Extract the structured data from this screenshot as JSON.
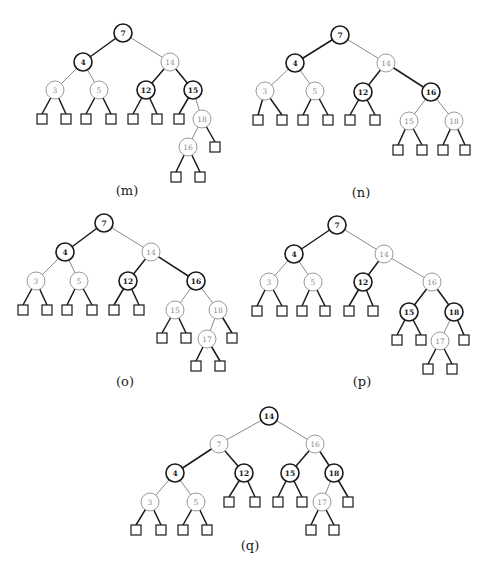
{
  "figure": {
    "colors": {
      "black_node": "#1a1a1a",
      "red_node": "#8a8a8a",
      "background": "#ffffff"
    },
    "node_radius": 9,
    "leaf_size": 10,
    "panels": [
      {
        "id": "m",
        "caption": "(m)",
        "caption_pos": [
          127,
          190
        ],
        "nodes": [
          {
            "id": "n7",
            "label": "7",
            "color": "black",
            "x": 123,
            "y": 33
          },
          {
            "id": "n4",
            "label": "4",
            "color": "black",
            "x": 83,
            "y": 62
          },
          {
            "id": "n14",
            "label": "14",
            "color": "red",
            "x": 170,
            "y": 62
          },
          {
            "id": "n3",
            "label": "3",
            "color": "red",
            "x": 55,
            "y": 90
          },
          {
            "id": "n5",
            "label": "5",
            "color": "red",
            "x": 99,
            "y": 90
          },
          {
            "id": "n12",
            "label": "12",
            "color": "black",
            "x": 146,
            "y": 90
          },
          {
            "id": "n15",
            "label": "15",
            "color": "black",
            "x": 193,
            "y": 90
          },
          {
            "id": "n18",
            "label": "18",
            "color": "red",
            "x": 202,
            "y": 119
          },
          {
            "id": "n16",
            "label": "16",
            "color": "red",
            "x": 188,
            "y": 147
          }
        ],
        "leaves": [
          {
            "id": "l1",
            "x": 42,
            "y": 119,
            "parent": "n3"
          },
          {
            "id": "l2",
            "x": 66,
            "y": 119,
            "parent": "n3"
          },
          {
            "id": "l3",
            "x": 86,
            "y": 119,
            "parent": "n5"
          },
          {
            "id": "l4",
            "x": 111,
            "y": 119,
            "parent": "n5"
          },
          {
            "id": "l5",
            "x": 133,
            "y": 119,
            "parent": "n12"
          },
          {
            "id": "l6",
            "x": 157,
            "y": 119,
            "parent": "n12"
          },
          {
            "id": "l7",
            "x": 179,
            "y": 119,
            "parent": "n15"
          },
          {
            "id": "l8",
            "x": 215,
            "y": 147,
            "parent": "n18"
          },
          {
            "id": "l9",
            "x": 176,
            "y": 177,
            "parent": "n16"
          },
          {
            "id": "l10",
            "x": 200,
            "y": 177,
            "parent": "n16"
          }
        ],
        "edges": [
          [
            "n7",
            "n4"
          ],
          [
            "n7",
            "n14"
          ],
          [
            "n4",
            "n3"
          ],
          [
            "n4",
            "n5"
          ],
          [
            "n14",
            "n12"
          ],
          [
            "n14",
            "n15"
          ],
          [
            "n15",
            "n18"
          ],
          [
            "n18",
            "n16"
          ]
        ]
      },
      {
        "id": "n",
        "caption": "(n)",
        "caption_pos": [
          361,
          192
        ],
        "nodes": [
          {
            "id": "n7",
            "label": "7",
            "color": "black",
            "x": 340,
            "y": 35
          },
          {
            "id": "n4",
            "label": "4",
            "color": "black",
            "x": 295,
            "y": 63
          },
          {
            "id": "n14",
            "label": "14",
            "color": "red",
            "x": 386,
            "y": 63
          },
          {
            "id": "n3",
            "label": "3",
            "color": "red",
            "x": 265,
            "y": 91
          },
          {
            "id": "n5",
            "label": "5",
            "color": "red",
            "x": 315,
            "y": 91
          },
          {
            "id": "n12",
            "label": "12",
            "color": "black",
            "x": 363,
            "y": 92
          },
          {
            "id": "n16",
            "label": "16",
            "color": "black",
            "x": 431,
            "y": 92
          },
          {
            "id": "n15",
            "label": "15",
            "color": "red",
            "x": 409,
            "y": 121
          },
          {
            "id": "n18",
            "label": "18",
            "color": "red",
            "x": 454,
            "y": 121
          }
        ],
        "leaves": [
          {
            "id": "l1",
            "x": 258,
            "y": 120,
            "parent": "n3"
          },
          {
            "id": "l2",
            "x": 282,
            "y": 120,
            "parent": "n3"
          },
          {
            "id": "l3",
            "x": 303,
            "y": 120,
            "parent": "n5"
          },
          {
            "id": "l4",
            "x": 328,
            "y": 120,
            "parent": "n5"
          },
          {
            "id": "l5",
            "x": 350,
            "y": 120,
            "parent": "n12"
          },
          {
            "id": "l6",
            "x": 375,
            "y": 120,
            "parent": "n12"
          },
          {
            "id": "l7",
            "x": 398,
            "y": 150,
            "parent": "n15"
          },
          {
            "id": "l8",
            "x": 422,
            "y": 150,
            "parent": "n15"
          },
          {
            "id": "l9",
            "x": 443,
            "y": 150,
            "parent": "n18"
          },
          {
            "id": "l10",
            "x": 465,
            "y": 150,
            "parent": "n18"
          }
        ],
        "edges": [
          [
            "n7",
            "n4"
          ],
          [
            "n7",
            "n14"
          ],
          [
            "n4",
            "n3"
          ],
          [
            "n4",
            "n5"
          ],
          [
            "n14",
            "n12"
          ],
          [
            "n14",
            "n16"
          ],
          [
            "n16",
            "n15"
          ],
          [
            "n16",
            "n18"
          ]
        ]
      },
      {
        "id": "o",
        "caption": "(o)",
        "caption_pos": [
          125,
          381
        ],
        "nodes": [
          {
            "id": "n7",
            "label": "7",
            "color": "black",
            "x": 104,
            "y": 223
          },
          {
            "id": "n4",
            "label": "4",
            "color": "black",
            "x": 65,
            "y": 252
          },
          {
            "id": "n14",
            "label": "14",
            "color": "red",
            "x": 151,
            "y": 252
          },
          {
            "id": "n3",
            "label": "3",
            "color": "red",
            "x": 36,
            "y": 281
          },
          {
            "id": "n5",
            "label": "5",
            "color": "red",
            "x": 79,
            "y": 281
          },
          {
            "id": "n12",
            "label": "12",
            "color": "black",
            "x": 128,
            "y": 281
          },
          {
            "id": "n16",
            "label": "16",
            "color": "black",
            "x": 196,
            "y": 281
          },
          {
            "id": "n15",
            "label": "15",
            "color": "red",
            "x": 175,
            "y": 310
          },
          {
            "id": "n18",
            "label": "18",
            "color": "red",
            "x": 218,
            "y": 310
          },
          {
            "id": "n17",
            "label": "17",
            "color": "red",
            "x": 207,
            "y": 339
          }
        ],
        "leaves": [
          {
            "id": "l1",
            "x": 23,
            "y": 310,
            "parent": "n3"
          },
          {
            "id": "l2",
            "x": 47,
            "y": 310,
            "parent": "n3"
          },
          {
            "id": "l3",
            "x": 67,
            "y": 310,
            "parent": "n5"
          },
          {
            "id": "l4",
            "x": 92,
            "y": 310,
            "parent": "n5"
          },
          {
            "id": "l5",
            "x": 114,
            "y": 310,
            "parent": "n12"
          },
          {
            "id": "l6",
            "x": 139,
            "y": 310,
            "parent": "n12"
          },
          {
            "id": "l7",
            "x": 162,
            "y": 338,
            "parent": "n15"
          },
          {
            "id": "l8",
            "x": 186,
            "y": 338,
            "parent": "n15"
          },
          {
            "id": "l9",
            "x": 232,
            "y": 338,
            "parent": "n18"
          },
          {
            "id": "l10",
            "x": 196,
            "y": 366,
            "parent": "n17"
          },
          {
            "id": "l11",
            "x": 220,
            "y": 366,
            "parent": "n17"
          }
        ],
        "edges": [
          [
            "n7",
            "n4"
          ],
          [
            "n7",
            "n14"
          ],
          [
            "n4",
            "n3"
          ],
          [
            "n4",
            "n5"
          ],
          [
            "n14",
            "n12"
          ],
          [
            "n14",
            "n16"
          ],
          [
            "n16",
            "n15"
          ],
          [
            "n16",
            "n18"
          ],
          [
            "n18",
            "n17"
          ]
        ]
      },
      {
        "id": "p",
        "caption": "(p)",
        "caption_pos": [
          362,
          381
        ],
        "nodes": [
          {
            "id": "n7",
            "label": "7",
            "color": "black",
            "x": 337,
            "y": 225
          },
          {
            "id": "n4",
            "label": "4",
            "color": "black",
            "x": 294,
            "y": 254
          },
          {
            "id": "n14",
            "label": "14",
            "color": "red",
            "x": 384,
            "y": 254
          },
          {
            "id": "n3",
            "label": "3",
            "color": "red",
            "x": 269,
            "y": 282
          },
          {
            "id": "n5",
            "label": "5",
            "color": "red",
            "x": 313,
            "y": 282
          },
          {
            "id": "n12",
            "label": "12",
            "color": "black",
            "x": 363,
            "y": 282
          },
          {
            "id": "n16",
            "label": "16",
            "color": "red",
            "x": 432,
            "y": 282
          },
          {
            "id": "n15",
            "label": "15",
            "color": "black",
            "x": 409,
            "y": 312
          },
          {
            "id": "n18",
            "label": "18",
            "color": "black",
            "x": 454,
            "y": 312
          },
          {
            "id": "n17",
            "label": "17",
            "color": "red",
            "x": 440,
            "y": 341
          }
        ],
        "leaves": [
          {
            "id": "l1",
            "x": 257,
            "y": 311,
            "parent": "n3"
          },
          {
            "id": "l2",
            "x": 282,
            "y": 311,
            "parent": "n3"
          },
          {
            "id": "l3",
            "x": 302,
            "y": 311,
            "parent": "n5"
          },
          {
            "id": "l4",
            "x": 325,
            "y": 311,
            "parent": "n5"
          },
          {
            "id": "l5",
            "x": 349,
            "y": 311,
            "parent": "n12"
          },
          {
            "id": "l6",
            "x": 373,
            "y": 311,
            "parent": "n12"
          },
          {
            "id": "l7",
            "x": 397,
            "y": 340,
            "parent": "n15"
          },
          {
            "id": "l8",
            "x": 421,
            "y": 340,
            "parent": "n15"
          },
          {
            "id": "l9",
            "x": 464,
            "y": 340,
            "parent": "n18"
          },
          {
            "id": "l10",
            "x": 428,
            "y": 369,
            "parent": "n17"
          },
          {
            "id": "l11",
            "x": 452,
            "y": 369,
            "parent": "n17"
          }
        ],
        "edges": [
          [
            "n7",
            "n4"
          ],
          [
            "n7",
            "n14"
          ],
          [
            "n4",
            "n3"
          ],
          [
            "n4",
            "n5"
          ],
          [
            "n14",
            "n12"
          ],
          [
            "n14",
            "n16"
          ],
          [
            "n16",
            "n15"
          ],
          [
            "n16",
            "n18"
          ],
          [
            "n18",
            "n17"
          ]
        ]
      },
      {
        "id": "q",
        "caption": "(q)",
        "caption_pos": [
          250,
          545
        ],
        "nodes": [
          {
            "id": "n14",
            "label": "14",
            "color": "black",
            "x": 269,
            "y": 416
          },
          {
            "id": "n7",
            "label": "7",
            "color": "red",
            "x": 219,
            "y": 444
          },
          {
            "id": "n16",
            "label": "16",
            "color": "red",
            "x": 315,
            "y": 444
          },
          {
            "id": "n4",
            "label": "4",
            "color": "black",
            "x": 175,
            "y": 473
          },
          {
            "id": "n12",
            "label": "12",
            "color": "black",
            "x": 244,
            "y": 473
          },
          {
            "id": "n15",
            "label": "15",
            "color": "black",
            "x": 290,
            "y": 473
          },
          {
            "id": "n18",
            "label": "18",
            "color": "black",
            "x": 334,
            "y": 473
          },
          {
            "id": "n3",
            "label": "3",
            "color": "red",
            "x": 150,
            "y": 502
          },
          {
            "id": "n5",
            "label": "5",
            "color": "red",
            "x": 196,
            "y": 502
          },
          {
            "id": "n17",
            "label": "17",
            "color": "red",
            "x": 322,
            "y": 502
          }
        ],
        "leaves": [
          {
            "id": "l1",
            "x": 229,
            "y": 502,
            "parent": "n12"
          },
          {
            "id": "l2",
            "x": 255,
            "y": 502,
            "parent": "n12"
          },
          {
            "id": "l3",
            "x": 278,
            "y": 502,
            "parent": "n15"
          },
          {
            "id": "l4",
            "x": 302,
            "y": 502,
            "parent": "n15"
          },
          {
            "id": "l5",
            "x": 348,
            "y": 502,
            "parent": "n18"
          },
          {
            "id": "l6",
            "x": 136,
            "y": 530,
            "parent": "n3"
          },
          {
            "id": "l7",
            "x": 161,
            "y": 530,
            "parent": "n3"
          },
          {
            "id": "l8",
            "x": 183,
            "y": 530,
            "parent": "n5"
          },
          {
            "id": "l9",
            "x": 207,
            "y": 530,
            "parent": "n5"
          },
          {
            "id": "l10",
            "x": 311,
            "y": 530,
            "parent": "n17"
          },
          {
            "id": "l11",
            "x": 334,
            "y": 530,
            "parent": "n17"
          }
        ],
        "edges": [
          [
            "n14",
            "n7"
          ],
          [
            "n14",
            "n16"
          ],
          [
            "n7",
            "n4"
          ],
          [
            "n7",
            "n12"
          ],
          [
            "n16",
            "n15"
          ],
          [
            "n16",
            "n18"
          ],
          [
            "n4",
            "n3"
          ],
          [
            "n4",
            "n5"
          ],
          [
            "n18",
            "n17"
          ]
        ]
      }
    ]
  }
}
